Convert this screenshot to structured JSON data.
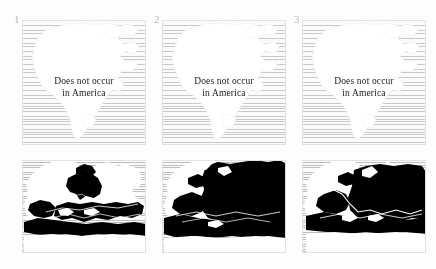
{
  "figure": {
    "background_color": "#fdfdfc",
    "ocean_hatch_color": "#c9c9c6",
    "land_color": "#ffffff",
    "distribution_color": "#000000",
    "panel_label_color": "#b9b9b6"
  },
  "panels": [
    {
      "number": "1",
      "top_map": {
        "region": "North America",
        "caption_line_1": "Does not occur",
        "caption_line_2": "in America"
      },
      "bottom_map": {
        "region": "Europe and Mediterranean",
        "coverage": "Mediterranean basin, Iberia, southern France, Italy, Balkans, Black Sea coast, North Africa"
      }
    },
    {
      "number": "2",
      "top_map": {
        "region": "North America",
        "caption_line_1": "Does not occur",
        "caption_line_2": "in America"
      },
      "bottom_map": {
        "region": "Europe and Mediterranean",
        "coverage": "Most of continental Europe, Scandinavia south, eastern Europe, Mediterranean basin, North Africa"
      }
    },
    {
      "number": "3",
      "top_map": {
        "region": "North America",
        "caption_line_1": "Does not occur",
        "caption_line_2": "in America"
      },
      "bottom_map": {
        "region": "Europe and Mediterranean",
        "coverage": "Central and eastern Europe, Balkans, Anatolia, Mediterranean, North Africa"
      }
    }
  ]
}
